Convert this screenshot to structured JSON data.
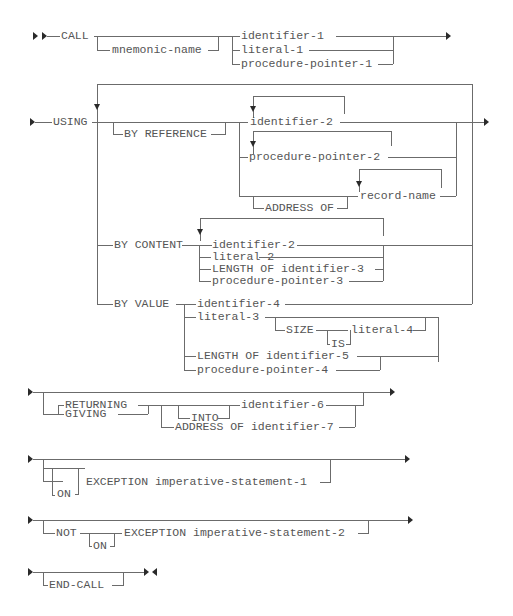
{
  "diagram": {
    "colors": {
      "line": "#6b6b6b",
      "text": "#555555",
      "arrow": "#2a2a2a",
      "background": "#ffffff"
    },
    "call_clause": {
      "keyword": "CALL",
      "optional": "mnemonic-name",
      "choices": [
        "identifier-1",
        "literal-1",
        "procedure-pointer-1"
      ]
    },
    "using_clause": {
      "keyword": "USING",
      "by_reference": {
        "keyword": "BY REFERENCE",
        "items": [
          "identifier-2",
          "procedure-pointer-2",
          "record-name"
        ],
        "address_of": "ADDRESS OF"
      },
      "by_content": {
        "keyword": "BY CONTENT",
        "items": [
          "identifier-2",
          "literal-2",
          "LENGTH OF identifier-3",
          "procedure-pointer-3"
        ]
      },
      "by_value": {
        "keyword": "BY VALUE",
        "items": [
          "identifier-4",
          "literal-3",
          "LENGTH OF identifier-5",
          "procedure-pointer-4"
        ],
        "size": "SIZE",
        "is": "IS",
        "size_value": "literal-4"
      }
    },
    "returning_clause": {
      "keywords": [
        "RETURNING",
        "GIVING"
      ],
      "into": "INTO",
      "identifier": "identifier-6",
      "address_of": "ADDRESS OF identifier-7"
    },
    "exception_clause": {
      "on": "ON",
      "text": "EXCEPTION imperative-statement-1"
    },
    "not_exception_clause": {
      "not": "NOT",
      "on": "ON",
      "text": "EXCEPTION imperative-statement-2"
    },
    "end_clause": {
      "keyword": "END-CALL"
    }
  }
}
